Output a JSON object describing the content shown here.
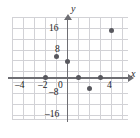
{
  "figure": {
    "axis_labels": {
      "x": "x",
      "y": "y"
    },
    "x_ticks": [
      {
        "value": -4,
        "label": "–4"
      },
      {
        "value": -2,
        "label": "–2"
      },
      {
        "value": 0,
        "label": "0"
      },
      {
        "value": 4,
        "label": "4"
      }
    ],
    "y_ticks": [
      {
        "value": 16,
        "label": "16"
      },
      {
        "value": 8,
        "label": "8"
      },
      {
        "value": -8,
        "label": "–8"
      },
      {
        "value": -16,
        "label": "–16"
      }
    ],
    "colors": {
      "grid": "#d2d2d6",
      "axis": "#6e6e73",
      "point": "#58585e",
      "text": "#1c1c1e",
      "background": "#ffffff"
    }
  },
  "chart_data": {
    "type": "scatter",
    "title": "",
    "xlabel": "x",
    "ylabel": "y",
    "xlim": [
      -5,
      5
    ],
    "ylim": [
      -20,
      20
    ],
    "grid": true,
    "legend": "none",
    "x_tick_values": [
      -4,
      -2,
      0,
      4
    ],
    "x_tick_labels": [
      "–4",
      "–2",
      "0",
      "4"
    ],
    "y_tick_values": [
      16,
      8,
      -8,
      -16
    ],
    "y_tick_labels": [
      "16",
      "8",
      "–8",
      "–16"
    ],
    "points": [
      {
        "x": -2,
        "y": 0
      },
      {
        "x": -1,
        "y": 8
      },
      {
        "x": 0,
        "y": 6
      },
      {
        "x": 1,
        "y": 0
      },
      {
        "x": 2,
        "y": -4
      },
      {
        "x": 3,
        "y": 0
      },
      {
        "x": 4,
        "y": 18
      }
    ]
  }
}
